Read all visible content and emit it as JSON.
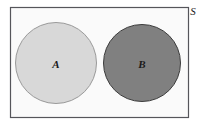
{
  "figure": {
    "type": "venn-diagram",
    "width": 208,
    "height": 124,
    "background_color": "#ffffff"
  },
  "universe": {
    "label": "S",
    "label_x": 193,
    "label_y": 10,
    "rect": {
      "x": 10.5,
      "y": 7.5,
      "width": 178,
      "height": 110
    },
    "fill_color": "#fafafa",
    "stroke_color": "#55555a",
    "stroke_width": 1.2
  },
  "sets": [
    {
      "label": "A",
      "cx": 56,
      "cy": 63,
      "r": 40.5,
      "fill_color": "#d8d8d8",
      "stroke_color": "#9a9a9a",
      "stroke_width": 1,
      "label_color": "#1a1a1a"
    },
    {
      "label": "B",
      "cx": 142,
      "cy": 63,
      "r": 38.5,
      "fill_color": "#808080",
      "stroke_color": "#3c3c3c",
      "stroke_width": 1,
      "label_color": "#101010"
    }
  ]
}
